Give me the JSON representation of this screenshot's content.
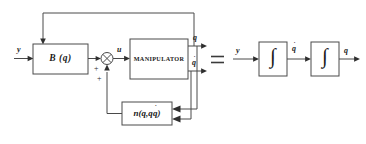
{
  "diagram": {
    "colors": {
      "line": "#4a4a4a",
      "text": "#1c1c1c",
      "background": "#ffffff"
    },
    "blocks": [
      {
        "id": "b-q",
        "label": "B (q)",
        "x": 33,
        "y": 44,
        "w": 55,
        "h": 30
      },
      {
        "id": "manipulator",
        "label": "MANIPULATOR",
        "x": 111,
        "y": 39,
        "w": 70,
        "h": 40
      },
      {
        "id": "n-q-qdot",
        "label": "n(q,q̇)",
        "x": 122,
        "y": 102,
        "w": 50,
        "h": 23
      },
      {
        "id": "integrator-1",
        "label": "∫",
        "x": 261,
        "y": 42,
        "w": 27,
        "h": 34
      },
      {
        "id": "integrator-2",
        "label": "∫",
        "x": 313,
        "y": 42,
        "w": 27,
        "h": 34
      }
    ],
    "signals": {
      "input_left": "y",
      "sum_output": "u",
      "sum_sign_top": "+",
      "sum_sign_bottom": "+",
      "manipulator_out_pos": "q",
      "manipulator_out_vel": "q̇",
      "equivalence": "=",
      "right_input": "y",
      "right_mid": "q̇",
      "right_output": "q"
    },
    "labels": {
      "b_block": "B (q)",
      "manipulator_block": "MANIPULATOR",
      "n_block_base": "n(q,q",
      "n_block_close": ")",
      "integral_symbol": "∫"
    }
  }
}
